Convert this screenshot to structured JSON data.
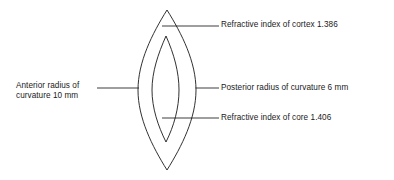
{
  "figure": {
    "background_color": "#ffffff",
    "stroke_color": "#1a1a1a",
    "width": 394,
    "height": 180
  },
  "labels": {
    "anterior": {
      "line1": "Anterior radius of",
      "line2": "curvature 10 mm",
      "full": "Anterior radius of curvature 10 mm"
    },
    "cortex": {
      "line1": "Refractive index of cortex 1.386",
      "full": "Refractive index of cortex 1.386"
    },
    "posterior": {
      "line1": "Posterior radius of curvature 6 mm",
      "full": "Posterior radius of curvature 6 mm"
    },
    "core": {
      "line1": "Refractive index of core 1.406",
      "full": "Refractive index of core 1.406"
    }
  },
  "values": {
    "anterior_radius_of_curvature": "10 mm",
    "posterior_radius_of_curvature": "6 mm",
    "refractive_index_cortex": "1.386",
    "refractive_index_core": "1.406"
  },
  "shapes": {
    "outer_lens": {
      "name": "cortex-outline",
      "top_apex": [
        167,
        10
      ],
      "bottom_apex": [
        167,
        170
      ],
      "left_extreme": [
        138,
        90
      ],
      "right_extreme": [
        196,
        90
      ]
    },
    "inner_lens": {
      "name": "core-outline",
      "top_apex": [
        166,
        36
      ],
      "bottom_apex": [
        166,
        142
      ],
      "left_extreme": [
        152,
        90
      ],
      "right_extreme": [
        179,
        90
      ]
    }
  },
  "leader_lines": [
    {
      "name": "leader-cortex",
      "from": [
        162,
        26
      ],
      "to": [
        219,
        26
      ]
    },
    {
      "name": "leader-posterior",
      "from": [
        196,
        88
      ],
      "to": [
        219,
        88
      ]
    },
    {
      "name": "leader-core",
      "from": [
        162,
        118
      ],
      "to": [
        219,
        118
      ]
    },
    {
      "name": "leader-anterior",
      "from": [
        97,
        88
      ],
      "to": [
        139,
        88
      ]
    }
  ]
}
